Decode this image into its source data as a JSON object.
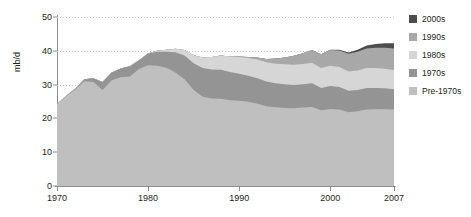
{
  "chart_data": {
    "type": "area",
    "stacked": true,
    "title": "",
    "xlabel": "",
    "ylabel": "mb/d",
    "xlim": [
      1970,
      2007
    ],
    "ylim": [
      0,
      50
    ],
    "yticks": [
      0,
      10,
      20,
      30,
      40,
      50
    ],
    "xticks": [
      1970,
      1980,
      1990,
      2000,
      2007
    ],
    "grid": "horizontal-dotted",
    "legend_position": "right",
    "x": [
      1970,
      1971,
      1972,
      1973,
      1974,
      1975,
      1976,
      1977,
      1978,
      1979,
      1980,
      1981,
      1982,
      1983,
      1984,
      1985,
      1986,
      1987,
      1988,
      1989,
      1990,
      1991,
      1992,
      1993,
      1994,
      1995,
      1996,
      1997,
      1998,
      1999,
      2000,
      2001,
      2002,
      2003,
      2004,
      2005,
      2006,
      2007
    ],
    "series": [
      {
        "name": "Pre-1970s",
        "color": "#bfbfbf",
        "values": [
          24.2,
          26.6,
          28.5,
          31.0,
          30.8,
          28.4,
          31.3,
          32.2,
          32.4,
          34.6,
          35.7,
          35.6,
          35.0,
          33.6,
          31.6,
          28.4,
          26.4,
          25.9,
          25.8,
          25.4,
          25.2,
          24.9,
          24.3,
          23.6,
          23.3,
          23.1,
          23.0,
          23.2,
          23.4,
          22.4,
          22.8,
          22.6,
          21.8,
          22.1,
          22.6,
          22.7,
          22.7,
          22.6
        ]
      },
      {
        "name": "1970s",
        "color": "#949494",
        "values": [
          0.0,
          0.1,
          0.3,
          0.6,
          1.1,
          2.4,
          2.3,
          2.6,
          3.0,
          2.6,
          3.5,
          4.1,
          4.7,
          6.0,
          7.0,
          7.9,
          8.5,
          8.6,
          8.6,
          8.3,
          8.0,
          7.7,
          7.6,
          7.3,
          7.1,
          7.0,
          6.9,
          6.9,
          7.0,
          6.6,
          6.8,
          6.7,
          6.4,
          6.3,
          6.4,
          6.3,
          6.2,
          6.0
        ]
      },
      {
        "name": "1980s",
        "color": "#d6d6d6",
        "values": [
          0.0,
          0.0,
          0.0,
          0.0,
          0.0,
          0.0,
          0.0,
          0.0,
          0.0,
          0.0,
          0.1,
          0.3,
          0.6,
          1.0,
          1.6,
          2.4,
          3.1,
          3.7,
          4.2,
          4.6,
          5.0,
          5.3,
          5.5,
          5.7,
          5.8,
          5.9,
          6.0,
          6.0,
          6.1,
          5.9,
          6.0,
          5.9,
          5.7,
          5.8,
          5.9,
          5.9,
          5.8,
          5.7
        ]
      },
      {
        "name": "1990s",
        "color": "#a8a8a8",
        "values": [
          0.0,
          0.0,
          0.0,
          0.0,
          0.0,
          0.0,
          0.0,
          0.0,
          0.0,
          0.0,
          0.0,
          0.0,
          0.0,
          0.0,
          0.0,
          0.0,
          0.0,
          0.0,
          0.0,
          0.0,
          0.1,
          0.3,
          0.6,
          1.0,
          1.5,
          2.0,
          2.6,
          3.2,
          3.7,
          4.1,
          4.6,
          4.9,
          5.2,
          5.5,
          5.8,
          6.0,
          6.2,
          6.4
        ]
      },
      {
        "name": "2000s",
        "color": "#4d4d4d",
        "values": [
          0.0,
          0.0,
          0.0,
          0.0,
          0.0,
          0.0,
          0.0,
          0.0,
          0.0,
          0.0,
          0.0,
          0.0,
          0.0,
          0.0,
          0.0,
          0.0,
          0.0,
          0.0,
          0.0,
          0.0,
          0.0,
          0.0,
          0.0,
          0.0,
          0.0,
          0.0,
          0.0,
          0.0,
          0.0,
          0.0,
          0.1,
          0.2,
          0.4,
          0.6,
          0.9,
          1.1,
          1.3,
          1.5
        ]
      }
    ]
  },
  "axes": {
    "ylabel": "mb/d",
    "ytick_labels": [
      "0",
      "10",
      "20",
      "30",
      "40",
      "50"
    ],
    "xtick_labels": [
      "1970",
      "1980",
      "1990",
      "2000",
      "2007"
    ]
  },
  "legend": {
    "items": [
      {
        "label": "2000s",
        "color": "#4d4d4d"
      },
      {
        "label": "1990s",
        "color": "#a8a8a8"
      },
      {
        "label": "1980s",
        "color": "#d6d6d6"
      },
      {
        "label": "1970s",
        "color": "#949494"
      },
      {
        "label": "Pre-1970s",
        "color": "#bfbfbf"
      }
    ]
  }
}
